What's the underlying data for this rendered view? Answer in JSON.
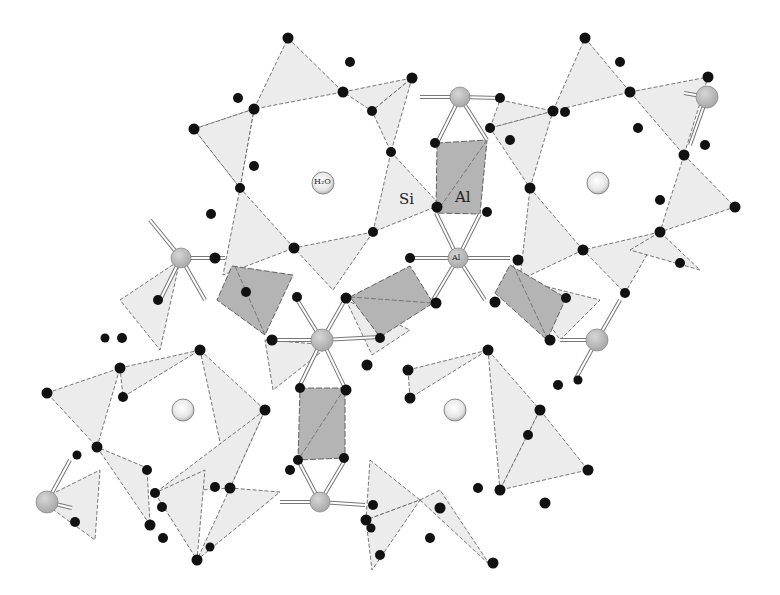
{
  "figure": {
    "type": "crystal-structure-projection",
    "labels": {
      "water": "H₂O",
      "silicon": "Si",
      "aluminum_octahedron": "Al",
      "aluminum_atom": "Al"
    },
    "legend_colors": {
      "tetrahedron_fill": "#ececec",
      "octahedron_fill": "#b4b4b4",
      "oxygen_atom": "#111111",
      "aluminum_atom": "#bdbdbd",
      "water_molecule": "#f4f4f4",
      "background": "#ffffff"
    },
    "components": {
      "channels_with_water": 4,
      "aluminum_octahedra_visible": 5,
      "aluminum_atoms_visible": 7
    }
  }
}
